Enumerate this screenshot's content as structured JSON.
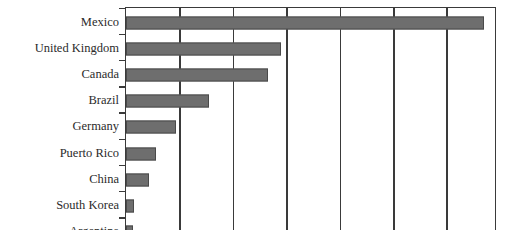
{
  "chart_data": {
    "type": "bar",
    "orientation": "horizontal",
    "title": "",
    "subtitle": "",
    "xlabel": "",
    "ylabel": "",
    "categories": [
      "Mexico",
      "United Kingdom",
      "Canada",
      "Brazil",
      "Germany",
      "Puerto Rico",
      "China",
      "South Korea",
      "Argentina"
    ],
    "values": [
      6.7,
      2.9,
      2.65,
      1.55,
      0.93,
      0.56,
      0.43,
      0.15,
      0.13
    ],
    "xlim": [
      0,
      7
    ],
    "xticks": [
      0,
      1,
      2,
      3,
      4,
      5,
      6,
      7
    ],
    "xticklabels": [],
    "grid": "vertical",
    "legend": "none"
  },
  "style": {
    "bar_fill": "#6e6e6e",
    "bar_stroke": "#4a4a4a",
    "axis_color": "#3a3a3a",
    "label_color": "#2b2b2b",
    "background": "#ffffff"
  }
}
